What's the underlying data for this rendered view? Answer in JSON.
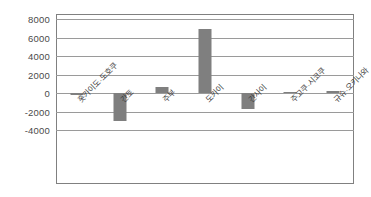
{
  "chart_data": {
    "type": "bar",
    "title": "",
    "subtitle": "",
    "xlabel": "",
    "ylabel": "",
    "categories": [
      "홋카이도·도호쿠",
      "간토",
      "주부",
      "도카이",
      "간사이",
      "주고쿠·시코쿠",
      "규슈·오키나와"
    ],
    "values": [
      -250,
      -3050,
      600,
      6900,
      -1750,
      80,
      200
    ],
    "ylim": [
      -4000,
      8000
    ],
    "yticks": [
      8000,
      6000,
      4000,
      2000,
      0,
      -2000,
      -4000
    ],
    "ytick_labels": [
      "8000",
      "6000",
      "4000",
      "2000",
      "0",
      "-2000",
      "-4000"
    ],
    "grid": true,
    "legend": false,
    "legend_position": "none",
    "series": [
      {
        "name": "",
        "color": "#7f7f7f",
        "values": [
          -250,
          -3050,
          600,
          6900,
          -1750,
          80,
          200
        ]
      }
    ]
  },
  "style": {
    "bar_color": "#7f7f7f",
    "grid_color": "#9a9a9a",
    "frame_color": "#808080",
    "text_color": "#3d3d3d",
    "background": "#ffffff"
  }
}
